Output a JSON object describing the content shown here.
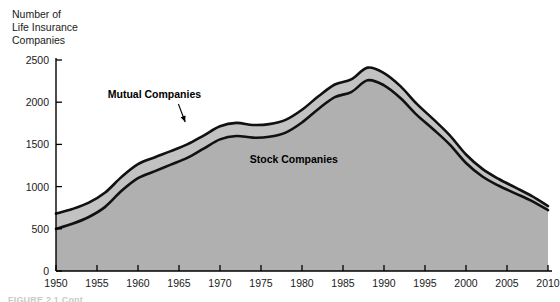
{
  "chart_data": {
    "type": "area",
    "title": "Number of Life Insurance Companies",
    "title_lines": [
      "Number of",
      "Life Insurance",
      "Companies"
    ],
    "xlabel": "",
    "ylabel": "Number of Life Insurance Companies",
    "stacked": true,
    "grid": false,
    "legend_position": "inline-annotation",
    "xlim": [
      1950,
      2010
    ],
    "ylim": [
      0,
      2500
    ],
    "x_ticks": [
      1950,
      1955,
      1960,
      1965,
      1970,
      1975,
      1980,
      1985,
      1990,
      1995,
      2000,
      2005,
      2010
    ],
    "y_ticks": [
      0,
      500,
      1000,
      1500,
      2000,
      2500
    ],
    "x_tick_labels": [
      "1950",
      "1955",
      "1960",
      "1965",
      "1970",
      "1975",
      "1980",
      "1985",
      "1990",
      "1995",
      "2000",
      "2005",
      "2010"
    ],
    "y_tick_labels": [
      "0",
      "500",
      "1000",
      "1500",
      "2000",
      "2500"
    ],
    "annotations": [
      {
        "text": "Mutual Companies",
        "x": 1962,
        "y": 2050,
        "arrow_to_x": 1966,
        "arrow_to_y": 1730
      },
      {
        "text": "Stock Companies",
        "x": 1979,
        "y": 1280,
        "arrow_to_x": null,
        "arrow_to_y": null
      }
    ],
    "x": [
      1950,
      1952,
      1954,
      1956,
      1958,
      1960,
      1962,
      1964,
      1966,
      1968,
      1970,
      1972,
      1974,
      1976,
      1978,
      1980,
      1982,
      1984,
      1986,
      1988,
      1990,
      1992,
      1994,
      1996,
      1998,
      2000,
      2002,
      2004,
      2006,
      2008,
      2010
    ],
    "series": [
      {
        "name": "Stock Companies",
        "color": "#b0b0b0",
        "values": [
          500,
          560,
          640,
          760,
          950,
          1100,
          1180,
          1260,
          1340,
          1450,
          1560,
          1600,
          1580,
          1590,
          1640,
          1760,
          1920,
          2060,
          2120,
          2260,
          2200,
          2050,
          1850,
          1680,
          1500,
          1280,
          1120,
          1010,
          920,
          830,
          720
        ]
      },
      {
        "name": "Mutual Companies",
        "color": "#c0c0c0",
        "values": [
          180,
          175,
          170,
          170,
          165,
          165,
          165,
          160,
          160,
          155,
          155,
          155,
          150,
          150,
          150,
          150,
          150,
          150,
          150,
          150,
          145,
          140,
          130,
          120,
          110,
          100,
          90,
          80,
          70,
          60,
          50
        ]
      }
    ],
    "totals": [
      680,
      735,
      810,
      930,
      1115,
      1265,
      1345,
      1420,
      1500,
      1605,
      1715,
      1755,
      1730,
      1740,
      1790,
      1910,
      2070,
      2210,
      2270,
      2410,
      2345,
      2190,
      1980,
      1800,
      1610,
      1380,
      1210,
      1090,
      990,
      890,
      770
    ],
    "peak": {
      "year": 1988,
      "total": 2410
    },
    "colors": {
      "stock_fill": "#b0b0b0",
      "mutual_fill": "#c2c2c2",
      "line": "#111111",
      "axis": "#000000",
      "text": "#1a1a1a",
      "background": "#ffffff"
    }
  },
  "caption": {
    "partial_text": "FIGURE 2.1 Cont"
  }
}
